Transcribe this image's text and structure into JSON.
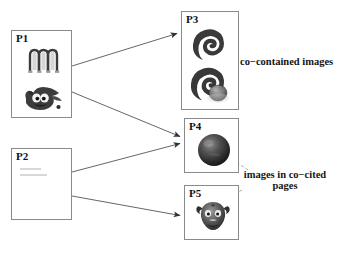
{
  "diagram": {
    "title": "",
    "background": "#ffffff",
    "line_color": "#555555",
    "dashed_color": "#9a9a9a",
    "box_border": "#8a8a8a"
  },
  "pages": [
    {
      "id": "P1",
      "label": "P1",
      "x": 11,
      "y": 30,
      "w": 61,
      "h": 88,
      "kind": "page-with-images",
      "images": [
        {
          "name": "mandrake-m-logo",
          "alt": "stylized letter m logo"
        },
        {
          "name": "gimp-wilber-logo",
          "alt": "gimp mascot wilber"
        }
      ]
    },
    {
      "id": "P2",
      "label": "P2",
      "x": 11,
      "y": 148,
      "w": 61,
      "h": 72,
      "kind": "page-text-only",
      "text_lines": 2
    },
    {
      "id": "P3",
      "label": "P3",
      "x": 181,
      "y": 11,
      "w": 58,
      "h": 99,
      "kind": "page-with-images",
      "images": [
        {
          "name": "debian-swirl-logo-plain",
          "alt": "debian swirl"
        },
        {
          "name": "debian-swirl-logo-shaded",
          "alt": "debian swirl with shading"
        }
      ]
    },
    {
      "id": "P4",
      "label": "P4",
      "x": 184,
      "y": 118,
      "w": 55,
      "h": 55,
      "kind": "page-with-images",
      "images": [
        {
          "name": "dark-globe-sphere",
          "alt": "dark shaded sphere"
        }
      ]
    },
    {
      "id": "P5",
      "label": "P5",
      "x": 184,
      "y": 185,
      "w": 55,
      "h": 55,
      "kind": "page-with-images",
      "images": [
        {
          "name": "gnu-head-logo",
          "alt": "gnu head"
        }
      ]
    }
  ],
  "arrows": [
    {
      "name": "arrow-p1-to-p3",
      "from": "P1",
      "to": "P3",
      "x1": 72,
      "y1": 66,
      "x2": 179,
      "y2": 33
    },
    {
      "name": "arrow-p1-to-p4",
      "from": "P1",
      "to": "P4",
      "x1": 72,
      "y1": 92,
      "x2": 182,
      "y2": 137
    },
    {
      "name": "arrow-p2-to-p4",
      "from": "P2",
      "to": "P4",
      "x1": 72,
      "y1": 172,
      "x2": 182,
      "y2": 143
    },
    {
      "name": "arrow-p2-to-p5",
      "from": "P2",
      "to": "P5",
      "x1": 72,
      "y1": 196,
      "x2": 182,
      "y2": 216
    }
  ],
  "annotations": [
    {
      "name": "co-contained-images-label",
      "text": "co−contained images",
      "x": 240,
      "y": 56,
      "leaders": [
        {
          "x1": 238,
          "y1": 60,
          "x2": 211,
          "y2": 46
        },
        {
          "x1": 238,
          "y1": 66,
          "x2": 211,
          "y2": 88
        }
      ]
    },
    {
      "name": "images-in-co-cited-pages-label",
      "line1": "images in co−cited",
      "line2": "pages",
      "x": 231,
      "y": 170,
      "leaders": [
        {
          "x1": 245,
          "y1": 172,
          "x2": 222,
          "y2": 155
        },
        {
          "x1": 240,
          "y1": 192,
          "x2": 211,
          "y2": 207
        }
      ]
    }
  ]
}
